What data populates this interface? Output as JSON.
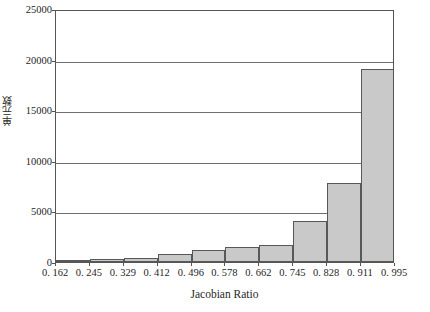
{
  "chart_data": {
    "type": "bar",
    "title": "",
    "subtitle": "",
    "xlabel": "Jacobian Ratio",
    "ylabel": "单元数",
    "ylim": [
      0,
      25000
    ],
    "xlim": [
      0.162,
      0.995
    ],
    "grid": true,
    "legend": null,
    "y_ticks": [
      {
        "value": 25000,
        "label": "25000"
      },
      {
        "value": 20000,
        "label": "20000"
      },
      {
        "value": 15000,
        "label": "15000"
      },
      {
        "value": 10000,
        "label": "10000"
      },
      {
        "value": 5000,
        "label": "5000"
      },
      {
        "value": 0,
        "label": "0"
      }
    ],
    "bin_edges": [
      0.162,
      0.245,
      0.329,
      0.412,
      0.496,
      0.578,
      0.662,
      0.745,
      0.828,
      0.911,
      0.995
    ],
    "bin_edge_labels": [
      "0. 162",
      "0. 245",
      "0. 329",
      "0. 412",
      "0. 496",
      "0. 578",
      "0. 662",
      "0. 745",
      "0. 828",
      "0. 911",
      "0. 995"
    ],
    "categories": [
      "0.162-0.245",
      "0.245-0.329",
      "0.329-0.412",
      "0.412-0.496",
      "0.496-0.578",
      "0.578-0.662",
      "0.662-0.745",
      "0.745-0.828",
      "0.828-0.911",
      "0.911-0.995"
    ],
    "values": [
      150,
      300,
      350,
      800,
      1200,
      1450,
      1700,
      4050,
      7800,
      19100
    ],
    "bar_fill_color": "#c9c9c9",
    "bar_border_color": "#585858",
    "gridline_color": "#6e6e6e",
    "axis_color": "#555555",
    "background_color": "#ffffff"
  }
}
